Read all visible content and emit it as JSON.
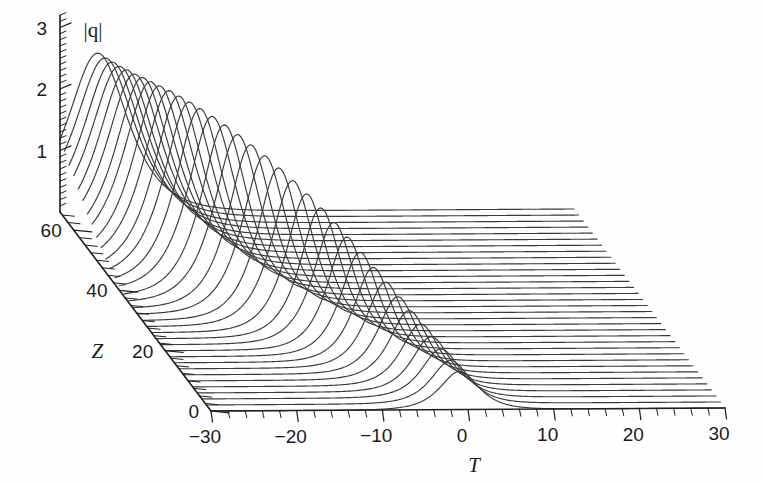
{
  "chart_data": {
    "type": "line",
    "subtype": "waterfall-3d-mesh",
    "title": "",
    "axes": {
      "x": {
        "label": "T",
        "ticks": [
          -30,
          -20,
          -10,
          0,
          10,
          20,
          30
        ],
        "tick_labels": [
          "−30",
          "−20",
          "−10",
          "0",
          "10",
          "20",
          "30"
        ],
        "range": [
          -30,
          30
        ],
        "minor_tick_step": 2
      },
      "y": {
        "label": "Z",
        "ticks": [
          0,
          20,
          40,
          60
        ],
        "tick_labels": [
          "0",
          "20",
          "40",
          "60"
        ],
        "range": [
          0,
          66
        ],
        "minor_tick_step": 2.5
      },
      "z": {
        "label": "|q|",
        "ticks": [
          1,
          2,
          3
        ],
        "tick_labels": [
          "1",
          "2",
          "3"
        ],
        "range": [
          0,
          3.2
        ],
        "minor_tick_step": 0.1
      }
    },
    "grid": false,
    "legend": null,
    "series_count": 34,
    "z_values": [
      0,
      2,
      4,
      6,
      8,
      10,
      12,
      14,
      16,
      18,
      20,
      22,
      24,
      26,
      28,
      30,
      32,
      34,
      36,
      38,
      40,
      42,
      44,
      46,
      48,
      50,
      52,
      54,
      56,
      58,
      60,
      62,
      64,
      66
    ],
    "peak_amplitudes": [
      0.62,
      0.7,
      0.79,
      0.89,
      1.0,
      1.12,
      1.25,
      1.39,
      1.53,
      1.68,
      1.83,
      1.97,
      2.11,
      2.24,
      2.36,
      2.47,
      2.57,
      2.65,
      2.72,
      2.78,
      2.82,
      2.85,
      2.86,
      2.86,
      2.85,
      2.83,
      2.8,
      2.77,
      2.73,
      2.7,
      2.66,
      2.63,
      2.6,
      2.58
    ],
    "peak_positions_T": [
      -1.0,
      -1.5,
      -2.1,
      -2.7,
      -3.4,
      -4.2,
      -5.0,
      -5.9,
      -6.8,
      -7.8,
      -8.8,
      -9.8,
      -10.8,
      -11.9,
      -13.0,
      -14.1,
      -15.2,
      -16.3,
      -17.3,
      -18.3,
      -19.2,
      -20.1,
      -20.8,
      -21.5,
      -22.1,
      -22.7,
      -23.2,
      -23.6,
      -24.0,
      -24.4,
      -24.7,
      -25.0,
      -25.3,
      -25.6
    ],
    "peak_widths_T": [
      2.0,
      2.0,
      2.0,
      2.0,
      2.0,
      2.0,
      2.0,
      2.0,
      2.0,
      2.0,
      2.0,
      2.1,
      2.1,
      2.1,
      2.2,
      2.2,
      2.3,
      2.3,
      2.4,
      2.4,
      2.5,
      2.5,
      2.6,
      2.6,
      2.7,
      2.7,
      2.8,
      2.8,
      2.9,
      2.9,
      3.0,
      3.0,
      3.1,
      3.1
    ],
    "baseline_amplitude": 0.0,
    "line_color": "#3a3a3a",
    "background_color": "#ffffff"
  },
  "projection": {
    "origin_x": 211,
    "origin_y": 411,
    "t_axis_dx": 514,
    "t_axis_dy": -3,
    "z_axis_dx": -151,
    "z_axis_dy": -199,
    "q_unit_px": 61.5
  },
  "labels": {
    "q_axis": "|q|",
    "t_axis": "T",
    "z_axis": "Z"
  }
}
